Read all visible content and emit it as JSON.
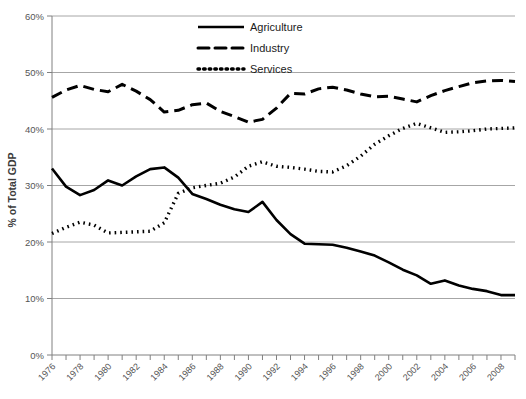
{
  "chart_data": {
    "type": "line",
    "title": "",
    "xlabel": "",
    "ylabel": "% of Total GDP",
    "ylim": [
      0,
      60
    ],
    "xlim": [
      1976,
      2009
    ],
    "grid": true,
    "legend_position": "top-center",
    "y_ticks": [
      "0%",
      "10%",
      "20%",
      "30%",
      "40%",
      "50%",
      "60%"
    ],
    "y_tick_values": [
      0,
      10,
      20,
      30,
      40,
      50,
      60
    ],
    "x": [
      1976,
      1977,
      1978,
      1979,
      1980,
      1981,
      1982,
      1983,
      1984,
      1985,
      1986,
      1987,
      1988,
      1989,
      1990,
      1991,
      1992,
      1993,
      1994,
      1995,
      1996,
      1997,
      1998,
      1999,
      2000,
      2001,
      2002,
      2003,
      2004,
      2005,
      2006,
      2007,
      2008,
      2009
    ],
    "x_tick_labels": [
      "1976",
      "1978",
      "1980",
      "1982",
      "1984",
      "1986",
      "1988",
      "1990",
      "1992",
      "1994",
      "1996",
      "1998",
      "2000",
      "2002",
      "2004",
      "2006",
      "2008"
    ],
    "series": [
      {
        "name": "Agriculture",
        "style": "solid",
        "color": "#000000",
        "values": [
          33.0,
          29.8,
          28.3,
          29.2,
          30.9,
          30.0,
          31.6,
          32.9,
          33.2,
          31.4,
          28.5,
          27.6,
          26.6,
          25.8,
          25.3,
          27.1,
          23.9,
          21.4,
          19.7,
          19.6,
          19.5,
          19.0,
          18.3,
          17.6,
          16.4,
          15.1,
          14.1,
          12.6,
          13.2,
          12.3,
          11.7,
          11.3,
          10.6,
          10.6
        ]
      },
      {
        "name": "Industry",
        "style": "dashed",
        "color": "#000000",
        "values": [
          45.6,
          46.9,
          47.7,
          47.0,
          46.6,
          47.9,
          46.7,
          45.2,
          43.0,
          43.3,
          44.3,
          44.6,
          43.1,
          42.2,
          41.2,
          41.7,
          43.7,
          46.3,
          46.2,
          47.1,
          47.4,
          46.9,
          46.2,
          45.7,
          45.8,
          45.3,
          44.8,
          45.9,
          46.8,
          47.5,
          48.2,
          48.5,
          48.6,
          48.4
        ]
      },
      {
        "name": "Services",
        "style": "dotted",
        "color": "#000000",
        "values": [
          21.5,
          22.6,
          23.5,
          23.0,
          21.6,
          21.7,
          21.8,
          21.9,
          23.4,
          28.6,
          29.6,
          30.0,
          30.4,
          31.5,
          33.4,
          34.2,
          33.4,
          33.2,
          32.9,
          32.5,
          32.4,
          33.5,
          35.2,
          37.3,
          38.8,
          40.1,
          41.0,
          40.2,
          39.4,
          39.5,
          39.7,
          40.0,
          40.1,
          40.2
        ]
      }
    ]
  },
  "legend": {
    "items": [
      {
        "label": "Agriculture",
        "style": "solid"
      },
      {
        "label": "Industry",
        "style": "dashed"
      },
      {
        "label": "Services",
        "style": "dotted"
      }
    ]
  },
  "axes": {
    "y_title": "% of Total GDP"
  }
}
